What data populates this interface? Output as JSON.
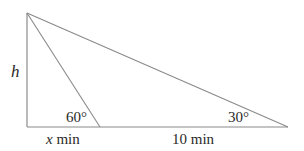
{
  "diagram": {
    "type": "right-triangle-elevation",
    "stroke_color": "#8a8a8a",
    "text_color": "#2a2a2a",
    "points": {
      "top": [
        27,
        13
      ],
      "foot": [
        27,
        127
      ],
      "near": [
        100,
        127
      ],
      "far": [
        288,
        127
      ]
    },
    "labels": {
      "height": "h",
      "near_angle": "60°",
      "far_angle": "30°",
      "near_distance_var": "x",
      "near_distance_unit": " min",
      "far_distance": "10 min"
    }
  }
}
